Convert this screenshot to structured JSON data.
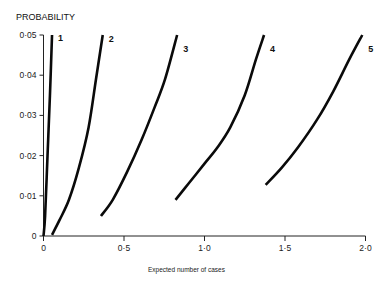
{
  "chart_data": {
    "type": "line",
    "title": "",
    "ylabel": "PROBABILITY",
    "xlabel": "Expected number of cases",
    "xlim": [
      0,
      2.0
    ],
    "ylim": [
      0,
      0.05
    ],
    "x_ticks": [
      0,
      0.5,
      1.0,
      1.5,
      2.0
    ],
    "x_tick_labels": [
      "0",
      "0·5",
      "1·0",
      "1·5",
      "2·0"
    ],
    "y_ticks": [
      0,
      0.01,
      0.02,
      0.03,
      0.04,
      0.05
    ],
    "y_tick_labels": [
      "0",
      "0·01",
      "0·02",
      "0·03",
      "0·04",
      "0·05"
    ],
    "grid": false,
    "legend": "inline labels at top of each curve",
    "series": [
      {
        "name": "1",
        "x": [
          0.0,
          0.01,
          0.025,
          0.04,
          0.053
        ],
        "y": [
          0.0,
          0.005,
          0.02,
          0.035,
          0.05
        ]
      },
      {
        "name": "2",
        "x": [
          0.053,
          0.1,
          0.158,
          0.22,
          0.28,
          0.326,
          0.368
        ],
        "y": [
          0.0003,
          0.004,
          0.009,
          0.017,
          0.027,
          0.039,
          0.05
        ]
      },
      {
        "name": "3",
        "x": [
          0.357,
          0.43,
          0.52,
          0.61,
          0.69,
          0.755,
          0.83
        ],
        "y": [
          0.005,
          0.009,
          0.016,
          0.024,
          0.032,
          0.039,
          0.05
        ]
      },
      {
        "name": "4",
        "x": [
          0.82,
          0.9,
          1.0,
          1.08,
          1.16,
          1.25,
          1.32,
          1.37
        ],
        "y": [
          0.009,
          0.013,
          0.018,
          0.022,
          0.027,
          0.035,
          0.044,
          0.05
        ]
      },
      {
        "name": "5",
        "x": [
          1.38,
          1.48,
          1.58,
          1.7,
          1.8,
          1.9,
          1.98
        ],
        "y": [
          0.0127,
          0.017,
          0.022,
          0.029,
          0.036,
          0.044,
          0.05
        ]
      }
    ]
  },
  "axes": {
    "ylabel": "PROBABILITY",
    "xlabel": "Expected number of cases"
  }
}
